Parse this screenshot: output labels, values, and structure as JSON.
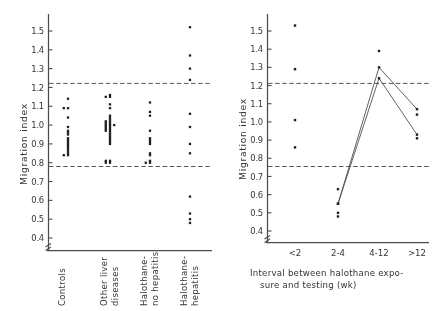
{
  "figure": {
    "name": "migration-index-figure",
    "y_axis_title": "Migration index",
    "reference_bands": {
      "upper": 1.16,
      "lower": 0.76,
      "style": "dashed"
    }
  },
  "chart_data": [
    {
      "type": "scatter",
      "panel": "left",
      "title": "",
      "xlabel": "",
      "ylabel": "Migration index",
      "ylim": [
        0.4,
        1.55
      ],
      "yticks": [
        0.4,
        0.5,
        0.6,
        0.7,
        0.8,
        0.9,
        1.0,
        1.1,
        1.2,
        1.3,
        1.4,
        1.5
      ],
      "ytick_labels": [
        "0.4",
        "0.5",
        "0.6",
        "0.7",
        "0.8",
        "0.9",
        "1.0",
        "1.1",
        "1.2",
        "1.3",
        "1.4",
        "1.5"
      ],
      "grid": false,
      "legend": "none",
      "reference_lines": [
        1.16,
        0.76
      ],
      "categories": [
        "Controls",
        "Other liver diseases",
        "Halothane-no hepatitis",
        "Halothane-hepatitis"
      ],
      "series": [
        {
          "name": "Controls",
          "values": [
            1.14,
            1.09,
            1.09,
            1.04,
            0.99,
            0.97,
            0.96,
            0.95,
            0.93,
            0.92,
            0.91,
            0.9,
            0.89,
            0.88,
            0.87,
            0.86,
            0.85,
            0.84,
            0.84
          ]
        },
        {
          "name": "Other liver diseases",
          "values": [
            1.16,
            1.15,
            1.15,
            1.11,
            1.09,
            1.05,
            1.04,
            1.03,
            1.02,
            1.02,
            1.01,
            1.01,
            1.0,
            1.0,
            1.0,
            0.99,
            0.99,
            0.98,
            0.98,
            0.97,
            0.97,
            0.96,
            0.95,
            0.94,
            0.93,
            0.92,
            0.91,
            0.9,
            0.81,
            0.81,
            0.8,
            0.8
          ]
        },
        {
          "name": "Halothane-no hepatitis",
          "values": [
            1.12,
            1.07,
            1.05,
            0.97,
            0.93,
            0.92,
            0.91,
            0.9,
            0.85,
            0.84,
            0.81,
            0.8,
            0.8
          ]
        },
        {
          "name": "Halothane-hepatitis",
          "values": [
            1.52,
            1.37,
            1.3,
            1.24,
            1.06,
            0.99,
            0.9,
            0.85,
            0.62,
            0.53,
            0.5,
            0.48
          ]
        }
      ]
    },
    {
      "type": "line",
      "panel": "right",
      "title": "",
      "xlabel": "Interval between halothane exposure and testing (wk)",
      "ylabel": "Migration index",
      "ylim": [
        0.4,
        1.55
      ],
      "yticks": [
        0.4,
        0.5,
        0.6,
        0.7,
        0.8,
        0.9,
        1.0,
        1.1,
        1.2,
        1.3,
        1.4,
        1.5
      ],
      "ytick_labels": [
        "0.4",
        "0.5",
        "0.6",
        "0.7",
        "0.8",
        "0.9",
        "1.0",
        "1.1",
        "1.2",
        "1.3",
        "1.4",
        "1.5"
      ],
      "grid": false,
      "legend": "none",
      "reference_lines": [
        1.16,
        0.76
      ],
      "categories": [
        "<2",
        "2-4",
        "4-12",
        ">12"
      ],
      "unconnected_points": [
        {
          "x": "<2",
          "values": [
            1.53,
            1.29,
            1.01,
            0.86
          ]
        },
        {
          "x": "2-4",
          "values": [
            0.63,
            0.5,
            0.48
          ]
        },
        {
          "x": "4-12",
          "values": [
            1.39
          ]
        },
        {
          "x": ">12",
          "values": [
            1.04,
            0.91
          ]
        }
      ],
      "series": [
        {
          "name": "patient-a",
          "x": [
            "2-4",
            "4-12",
            ">12"
          ],
          "values": [
            0.55,
            1.3,
            1.07
          ]
        },
        {
          "name": "patient-b",
          "x": [
            "2-4",
            "4-12",
            ">12"
          ],
          "values": [
            0.55,
            1.24,
            0.93
          ]
        }
      ]
    }
  ],
  "left_panel": {
    "y_axis_title": "Migration index",
    "category_labels": [
      {
        "line1": "Controls",
        "line2": ""
      },
      {
        "line1": "Other liver",
        "line2": "diseases"
      },
      {
        "line1": "Halothane-",
        "line2": "no hepatitis"
      },
      {
        "line1": "Halothane-",
        "line2": "hepatitis"
      }
    ],
    "ytick_labels": [
      "1.5",
      "1.4",
      "1.3",
      "1.2",
      "1.1",
      "1.0",
      "0.9",
      "0.8",
      "0.7",
      "0.6",
      "0.5",
      "0.4"
    ]
  },
  "right_panel": {
    "y_axis_title": "Migration index",
    "xtick_labels": [
      "<2",
      "2-4",
      "4-12",
      ">12"
    ],
    "caption_line1": "Interval between halothane expo-",
    "caption_line2": "sure and testing (wk)",
    "ytick_labels": [
      "1.5",
      "1.4",
      "1.3",
      "1.2",
      "1.1",
      "1.0",
      "0.9",
      "0.8",
      "0.7",
      "0.6",
      "0.5",
      "0.4"
    ]
  }
}
